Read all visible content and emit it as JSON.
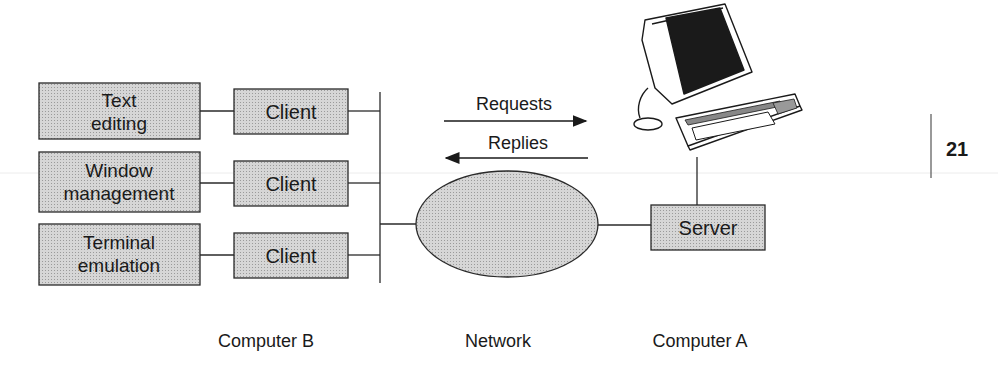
{
  "diagram": {
    "applications": [
      {
        "line1": "Text",
        "line2": "editing"
      },
      {
        "line1": "Window",
        "line2": "management"
      },
      {
        "line1": "Terminal",
        "line2": "emulation"
      }
    ],
    "clients": [
      "Client",
      "Client",
      "Client"
    ],
    "arrows": {
      "requests": "Requests",
      "replies": "Replies"
    },
    "server": "Server",
    "captions": {
      "computer_b": "Computer B",
      "network": "Network",
      "computer_a": "Computer A"
    },
    "page_number": "21",
    "colors": {
      "box_fill": "#cfcfcf",
      "stroke": "#2a2a2a",
      "screen": "#1a1a1a"
    }
  }
}
